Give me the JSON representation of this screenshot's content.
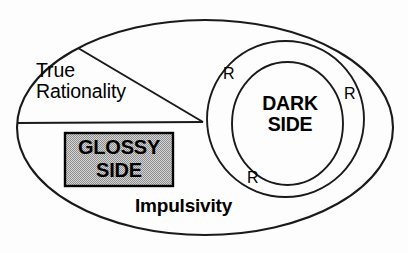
{
  "diagram": {
    "background_color": "#fdfdfd",
    "stroke_color": "#1a1a1a",
    "regions": {
      "outer": {
        "name": "Impulsivity",
        "label": "Impulsivity",
        "shape": "ellipse",
        "cx": 205,
        "cy": 127.5,
        "rx": 188,
        "ry": 107.5,
        "fill": "none"
      },
      "wedge": {
        "name": "True Rationality",
        "label": "True\nRationality",
        "label_line1": "True",
        "label_line2": "Rationality",
        "apex_x": 203,
        "apex_y": 122,
        "upper_x": 78,
        "upper_y": 48,
        "left_x": 17,
        "left_y": 123
      },
      "glossy_box": {
        "name": "Glossy Side",
        "label_line1": "GLOSSY",
        "label_line2": "SIDE",
        "x": 65,
        "y": 133,
        "w": 108,
        "h": 53,
        "fill_color": "#c0c0c0",
        "border_color": "#000000"
      },
      "middle_ellipse": {
        "name": "Dark Side outer ring",
        "cx": 285.5,
        "cy": 119,
        "rx": 78.5,
        "ry": 78
      },
      "inner_ellipse": {
        "name": "Dark Side core",
        "label_line1": "DARK",
        "label_line2": "SIDE",
        "cx": 287.5,
        "cy": 123.5,
        "rx": 55.5,
        "ry": 61.5
      }
    },
    "r_markers": [
      {
        "label": "R",
        "position": "top-left",
        "x": 223,
        "y": 65
      },
      {
        "label": "R",
        "position": "right",
        "x": 344,
        "y": 85
      },
      {
        "label": "R",
        "position": "bottom",
        "x": 247,
        "y": 169
      }
    ]
  }
}
